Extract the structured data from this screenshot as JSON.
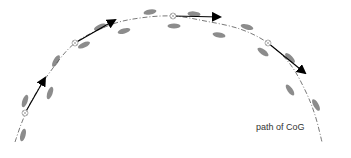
{
  "diagram": {
    "label": "path of CoG",
    "colors": {
      "path": "#555555",
      "footprint": "#8c8c8c",
      "arrow": "#000000",
      "marker": "#999999",
      "text": "#333333"
    },
    "path_points": [
      [
        15,
        142
      ],
      [
        22,
        122
      ],
      [
        32,
        100
      ],
      [
        50,
        72
      ],
      [
        75,
        43
      ],
      [
        110,
        25
      ],
      [
        140,
        18
      ],
      [
        173,
        16
      ],
      [
        205,
        21
      ],
      [
        240,
        29
      ],
      [
        268,
        43
      ],
      [
        290,
        64
      ],
      [
        305,
        90
      ],
      [
        315,
        115
      ],
      [
        322,
        142
      ]
    ],
    "markers": [
      {
        "x": 25,
        "y": 113
      },
      {
        "x": 75,
        "y": 43
      },
      {
        "x": 173,
        "y": 16
      },
      {
        "x": 268,
        "y": 43
      }
    ],
    "arrows": [
      {
        "x1": 25,
        "y1": 113,
        "x2": 45,
        "y2": 78
      },
      {
        "x1": 75,
        "y1": 43,
        "x2": 115,
        "y2": 20
      },
      {
        "x1": 173,
        "y1": 16,
        "x2": 220,
        "y2": 17
      },
      {
        "x1": 268,
        "y1": 43,
        "x2": 305,
        "y2": 73
      }
    ],
    "footprints": [
      {
        "x": 23,
        "y": 135,
        "angle": -75
      },
      {
        "x": 25,
        "y": 101,
        "angle": -70
      },
      {
        "x": 50,
        "y": 93,
        "angle": -70
      },
      {
        "x": 56,
        "y": 61,
        "angle": -60
      },
      {
        "x": 84,
        "y": 45,
        "angle": -25
      },
      {
        "x": 100,
        "y": 27,
        "angle": -25
      },
      {
        "x": 124,
        "y": 31,
        "angle": -15
      },
      {
        "x": 150,
        "y": 12,
        "angle": -10
      },
      {
        "x": 174,
        "y": 26,
        "angle": 0
      },
      {
        "x": 194,
        "y": 14,
        "angle": 5
      },
      {
        "x": 219,
        "y": 35,
        "angle": 10
      },
      {
        "x": 247,
        "y": 27,
        "angle": 15
      },
      {
        "x": 263,
        "y": 52,
        "angle": 35
      },
      {
        "x": 290,
        "y": 58,
        "angle": 45
      },
      {
        "x": 290,
        "y": 90,
        "angle": 55
      },
      {
        "x": 316,
        "y": 105,
        "angle": 60
      }
    ]
  }
}
